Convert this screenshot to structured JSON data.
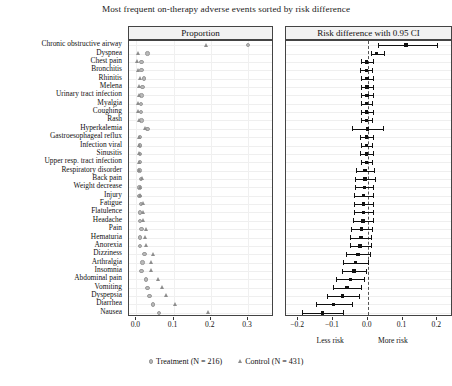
{
  "title": "Most frequent on-therapy adverse events sorted by risk difference",
  "panels": {
    "proportion_header": "Proportion",
    "riskdiff_header": "Risk difference with 0.95 CI"
  },
  "axis_sublabels": {
    "less": "Less risk",
    "more": "More risk"
  },
  "legend": [
    {
      "symbol": "circle",
      "label": "Treatment (N = 216)"
    },
    {
      "symbol": "triangle",
      "label": "Control (N = 431)"
    }
  ],
  "chart_data": {
    "type": "scatter",
    "title": "Most frequent on-therapy adverse events sorted by risk difference",
    "subtitle": "",
    "grid": true,
    "legend_position": "bottom",
    "panel_left": {
      "name": "Proportion",
      "xlabel": "",
      "xlim": [
        -0.02,
        0.37
      ],
      "ticks": [
        0.0,
        0.1,
        0.2,
        0.3
      ],
      "tick_labels": [
        "0.0",
        "0.1",
        "0.2",
        "0.3"
      ],
      "series": [
        {
          "name": "Treatment (N = 216)",
          "symbol": "circle",
          "color": "#b9b9b9"
        },
        {
          "name": "Control (N = 431)",
          "symbol": "triangle",
          "color": "#8d8d8d"
        }
      ]
    },
    "panel_right": {
      "name": "Risk difference with 0.95 CI",
      "xlabel": "",
      "xlim": [
        -0.235,
        0.245
      ],
      "ticks": [
        -0.2,
        -0.1,
        0.0,
        0.1,
        0.2
      ],
      "tick_labels": [
        "−0.2",
        "−0.1",
        "0.0",
        "0.1",
        "0.2"
      ],
      "reference_line": 0.0
    },
    "categories": [
      "Chronic obstructive airway",
      "Dyspnea",
      "Chest pain",
      "Bronchitis",
      "Rhinitis",
      "Melena",
      "Urinary tract infection",
      "Myalgia",
      "Coughing",
      "Rash",
      "Hyperkalemia",
      "Gastroesophageal reflux",
      "Infection viral",
      "Sinusitis",
      "Upper resp. tract infection",
      "Respiratory disorder",
      "Back pain",
      "Weight decrease",
      "Injury",
      "Fatigue",
      "Flatulence",
      "Headache",
      "Pain",
      "Hematuria",
      "Anorexia",
      "Dizziness",
      "Arthralgia",
      "Insomnia",
      "Abdominal pain",
      "Vomiting",
      "Dyspepsia",
      "Diarrhea",
      "Nausea"
    ],
    "treatment_proportion": [
      0.3,
      0.03,
      0.014,
      0.014,
      0.02,
      0.016,
      0.014,
      0.012,
      0.012,
      0.014,
      0.03,
      0.01,
      0.01,
      0.01,
      0.01,
      0.008,
      0.012,
      0.008,
      0.008,
      0.012,
      0.01,
      0.01,
      0.014,
      0.01,
      0.01,
      0.022,
      0.016,
      0.014,
      0.025,
      0.03,
      0.035,
      0.045,
      0.06
    ],
    "control_proportion": [
      0.19,
      0.006,
      0.005,
      0.006,
      0.012,
      0.01,
      0.008,
      0.007,
      0.007,
      0.01,
      0.026,
      0.008,
      0.009,
      0.009,
      0.01,
      0.01,
      0.016,
      0.012,
      0.013,
      0.02,
      0.019,
      0.021,
      0.028,
      0.026,
      0.028,
      0.048,
      0.042,
      0.04,
      0.06,
      0.072,
      0.082,
      0.105,
      0.195
    ],
    "risk_difference": [
      0.11,
      0.025,
      -0.004,
      -0.004,
      -0.002,
      -0.002,
      -0.002,
      -0.003,
      -0.004,
      -0.004,
      0.0,
      -0.004,
      -0.004,
      -0.004,
      -0.004,
      -0.008,
      -0.008,
      -0.01,
      -0.012,
      -0.012,
      -0.012,
      -0.014,
      -0.018,
      -0.02,
      -0.022,
      -0.028,
      -0.035,
      -0.04,
      -0.05,
      -0.06,
      -0.072,
      -0.098,
      -0.13
    ],
    "ci_lower": [
      0.03,
      0.008,
      -0.02,
      -0.022,
      -0.02,
      -0.018,
      -0.018,
      -0.018,
      -0.02,
      -0.018,
      -0.045,
      -0.022,
      -0.02,
      -0.022,
      -0.02,
      -0.035,
      -0.036,
      -0.038,
      -0.04,
      -0.04,
      -0.04,
      -0.042,
      -0.048,
      -0.05,
      -0.052,
      -0.062,
      -0.07,
      -0.075,
      -0.09,
      -0.1,
      -0.118,
      -0.15,
      -0.19
    ],
    "ci_upper": [
      0.2,
      0.048,
      0.014,
      0.012,
      0.016,
      0.016,
      0.014,
      0.012,
      0.014,
      0.012,
      0.045,
      0.014,
      0.012,
      0.014,
      0.012,
      0.018,
      0.02,
      0.016,
      0.016,
      0.016,
      0.016,
      0.014,
      0.012,
      0.01,
      0.008,
      0.006,
      0.0,
      -0.005,
      -0.01,
      -0.02,
      -0.026,
      -0.046,
      -0.07
    ]
  }
}
